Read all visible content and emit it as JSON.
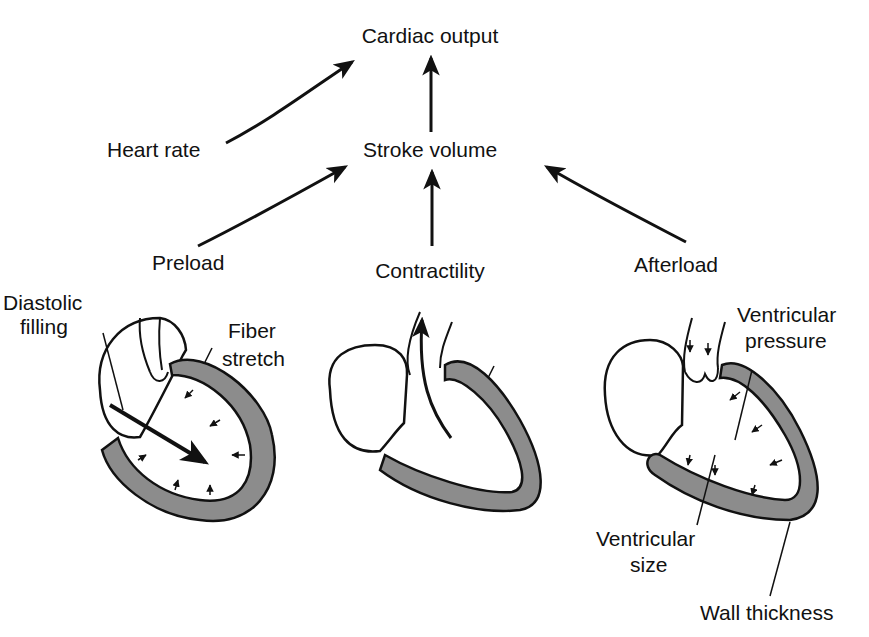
{
  "colors": {
    "ink": "#111111",
    "wall_fill": "#8c8c8c",
    "background": "#ffffff"
  },
  "flow": {
    "cardiac_output": "Cardiac output",
    "heart_rate": "Heart rate",
    "stroke_volume": "Stroke volume",
    "preload": "Preload",
    "contractility": "Contractility",
    "afterload": "Afterload"
  },
  "hearts": {
    "preload": {
      "labels": {
        "diastolic_1": "Diastolic",
        "diastolic_2": "filling",
        "fiber_1": "Fiber",
        "fiber_2": "stretch"
      }
    },
    "contractility": {
      "labels": {}
    },
    "afterload": {
      "labels": {
        "vp_1": "Ventricular",
        "vp_2": "pressure",
        "vs_1": "Ventricular",
        "vs_2": "size",
        "wall": "Wall thickness"
      }
    }
  }
}
